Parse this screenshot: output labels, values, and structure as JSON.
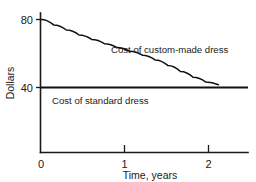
{
  "chart_data": {
    "type": "line",
    "title": "",
    "xlabel": "Time, years",
    "ylabel": "Dollars",
    "xlim": [
      0,
      2.45
    ],
    "ylim": [
      20,
      86
    ],
    "grid": false,
    "legend_position": "inline-annotation",
    "xticks": [
      {
        "value": 0,
        "label": "0"
      },
      {
        "value": 1,
        "label": "1"
      },
      {
        "value": 2,
        "label": "2"
      }
    ],
    "yticks": [
      {
        "value": 40,
        "label": "40"
      },
      {
        "value": 80,
        "label": "80"
      }
    ],
    "series": [
      {
        "name": "Cost of custom-made dress",
        "annotation": "Cost of custom-made dress",
        "style": "decaying-curve",
        "x": [
          0.0,
          0.15,
          0.3,
          0.45,
          0.6,
          0.75,
          0.9,
          1.05,
          1.2,
          1.35,
          1.5,
          1.65,
          1.8,
          1.95,
          2.1
        ],
        "values": [
          80.0,
          76.8,
          73.8,
          70.9,
          68.3,
          65.8,
          63.5,
          61.3,
          59.0,
          56.2,
          53.0,
          49.4,
          46.0,
          43.2,
          41.6
        ]
      },
      {
        "name": "Cost of standard dress",
        "annotation": "Cost of standard dress",
        "style": "horizontal-constant",
        "x": [
          0.0,
          2.45
        ],
        "values": [
          40,
          40
        ]
      }
    ]
  },
  "axis": {
    "y_title": "Dollars",
    "x_title": "Time, years",
    "ytick_80": "80",
    "ytick_40": "40",
    "xtick_0": "0",
    "xtick_1": "1",
    "xtick_2": "2"
  },
  "annotations": {
    "custom_made": "Cost of custom-made dress",
    "standard": "Cost of standard dress"
  },
  "colors": {
    "ink": "#111111",
    "background": "#ffffff"
  }
}
